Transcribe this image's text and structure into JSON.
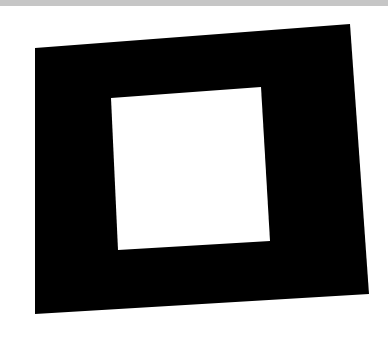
{
  "image": {
    "description": "Photograph of a black square frame (square with a white square hole) on white paper, slightly rotated and in perspective",
    "background_color": "#ffffff",
    "top_band_color": "#c6c6c6",
    "frame_color": "#000000",
    "hole_color": "#ffffff",
    "outer_polygon": "35,48 350,24 369,294 35,314",
    "inner_polygon": "111,98 261,87 270,241 118,250"
  }
}
